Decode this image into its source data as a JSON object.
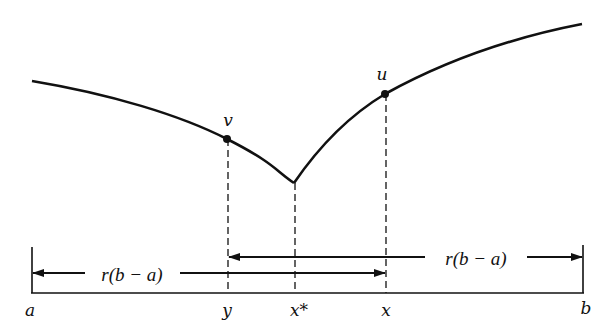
{
  "diagram": {
    "curve_points_labels": {
      "v": "v",
      "u": "u"
    },
    "axis_labels": {
      "a": "a",
      "y": "y",
      "x_star": "x*",
      "x": "x",
      "b": "b"
    },
    "interval_labels": {
      "lower": "r(b − a)",
      "upper": "r(b − a)"
    },
    "colors": {
      "ink": "#111111",
      "background": "#ffffff"
    }
  }
}
